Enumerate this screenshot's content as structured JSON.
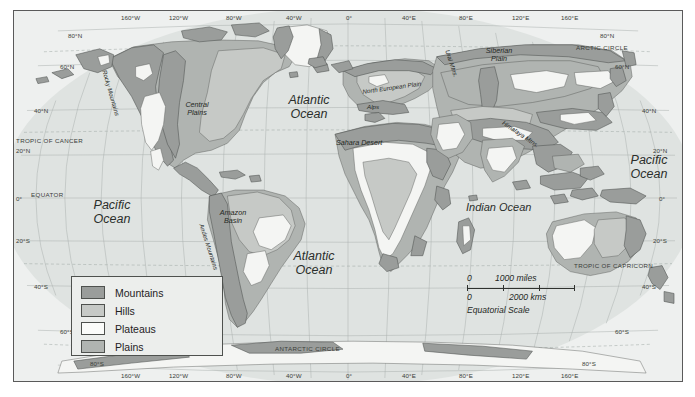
{
  "map": {
    "title": "World Physical Relief Map",
    "legend": {
      "items": [
        {
          "label": "Mountains",
          "color": "#9a9d9b"
        },
        {
          "label": "Hills",
          "color": "#c6c9c6"
        },
        {
          "label": "Plateaus",
          "color": "#fbfcfa"
        },
        {
          "label": "Plains",
          "color": "#b0b4b1"
        }
      ]
    },
    "scale": {
      "miles_zero": "0",
      "miles_value": "1000 miles",
      "kms_zero": "0",
      "kms_value": "2000 kms",
      "caption": "Equatorial Scale"
    },
    "oceans": [
      {
        "name": "atlantic-north",
        "line1": "Atlantic",
        "line2": "Ocean"
      },
      {
        "name": "atlantic-south",
        "line1": "Atlantic",
        "line2": "Ocean"
      },
      {
        "name": "pacific-east",
        "line1": "Pacific",
        "line2": "Ocean"
      },
      {
        "name": "pacific-west",
        "line1": "Pacific",
        "line2": "Ocean"
      },
      {
        "name": "indian",
        "line1": "Indian Ocean",
        "line2": ""
      }
    ],
    "features": [
      {
        "name": "rocky-mountains",
        "label": "Rocky Mountains"
      },
      {
        "name": "central-plains",
        "line1": "Central",
        "line2": "Plains"
      },
      {
        "name": "amazon-basin",
        "line1": "Amazon",
        "line2": "Basin"
      },
      {
        "name": "andes-mountains",
        "label": "Andes Mountains"
      },
      {
        "name": "sahara-desert",
        "label": "Sahara Desert"
      },
      {
        "name": "north-european-plain",
        "label": "North European Plain"
      },
      {
        "name": "alps",
        "label": "Alps"
      },
      {
        "name": "ural-mountains",
        "label": "Ural Mtns."
      },
      {
        "name": "siberian-plain",
        "line1": "Siberian",
        "line2": "Plain"
      },
      {
        "name": "himalaya-mountains",
        "label": "Himalaya Mtns."
      }
    ],
    "reference_lines": [
      {
        "name": "tropic-of-cancer",
        "label": "TROPIC OF CANCER"
      },
      {
        "name": "tropic-of-capricorn",
        "label": "TROPIC OF CAPRICORN"
      },
      {
        "name": "arctic-circle",
        "label": "ARCTIC CIRCLE"
      },
      {
        "name": "antarctic-circle",
        "label": "ANTARCTIC CIRCLE"
      },
      {
        "name": "equator",
        "label": "EQUATOR"
      }
    ],
    "longitude_ticks_top": [
      "160°W",
      "120°W",
      "80°W",
      "40°W",
      "0°",
      "40°E",
      "80°E",
      "120°E",
      "160°E"
    ],
    "longitude_ticks_bottom": [
      "160°W",
      "120°W",
      "80°W",
      "40°W",
      "0°",
      "40°E",
      "80°E",
      "120°E",
      "160°E"
    ],
    "latitude_ticks_left": [
      "80°N",
      "60°N",
      "40°N",
      "20°N",
      "0°",
      "20°S",
      "40°S",
      "60°S",
      "80°S"
    ],
    "latitude_ticks_right": [
      "80°N",
      "60°N",
      "40°N",
      "20°N",
      "0°",
      "20°S",
      "40°S",
      "60°S",
      "80°S"
    ]
  }
}
